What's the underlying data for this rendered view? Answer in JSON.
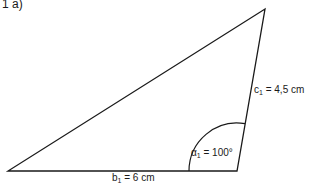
{
  "part_label": "1  a)",
  "triangle": {
    "vertices": {
      "A": [
        8,
        171
      ],
      "B": [
        237,
        171
      ],
      "C": [
        265,
        9
      ]
    },
    "stroke_color": "#1a1a1a",
    "side_b": {
      "name": "b",
      "sub": "1",
      "value": "= 6 cm"
    },
    "side_c": {
      "name": "c",
      "sub": "1",
      "value": "= 4,5 cm"
    },
    "angle_alpha": {
      "name": "α",
      "sub": "1",
      "value": "= 100°"
    }
  }
}
